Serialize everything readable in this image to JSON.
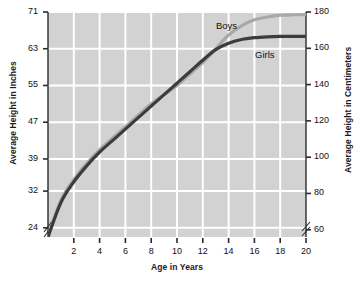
{
  "chart_data": {
    "type": "line",
    "title": "",
    "xlabel": "Age in Years",
    "ylabel": "Average Height in Inches",
    "ylabel_right": "Average Height in Centimeters",
    "xlim": [
      0,
      20
    ],
    "ylim_inches": [
      22,
      71
    ],
    "ylim_cm": [
      56,
      180
    ],
    "grid": true,
    "legend_position": "inline-annotation",
    "x_ticks": [
      2,
      4,
      6,
      8,
      10,
      12,
      14,
      16,
      18,
      20
    ],
    "y_ticks_left": [
      24,
      32,
      39,
      47,
      55,
      63,
      71
    ],
    "y_ticks_right": [
      60,
      80,
      100,
      120,
      140,
      160,
      180
    ],
    "axis_break_left": true,
    "axis_break_right": true,
    "plot_background_color": "#d2d2d2",
    "gridline_color": "#ffffff",
    "x": [
      0,
      1,
      2,
      3,
      4,
      5,
      6,
      7,
      8,
      9,
      10,
      11,
      12,
      13,
      14,
      15,
      16,
      17,
      18,
      19,
      20
    ],
    "series": [
      {
        "name": "Boys",
        "color": "#a8a8a8",
        "values": [
          22.0,
          30.0,
          34.5,
          38.0,
          41.0,
          43.5,
          46.0,
          48.5,
          51.0,
          53.0,
          55.0,
          57.5,
          60.0,
          63.0,
          66.0,
          68.0,
          69.3,
          69.9,
          70.3,
          70.4,
          70.4
        ]
      },
      {
        "name": "Girls",
        "color": "#3c3c3c",
        "values": [
          22.0,
          29.5,
          34.0,
          37.5,
          40.5,
          43.0,
          45.5,
          48.0,
          50.5,
          53.0,
          55.5,
          58.0,
          60.5,
          62.8,
          64.2,
          65.0,
          65.4,
          65.6,
          65.7,
          65.7,
          65.7
        ]
      }
    ],
    "annotations": [
      {
        "text": "Boys",
        "x_px": 216,
        "y_px": 20
      },
      {
        "text": "Girls",
        "x_px": 255,
        "y_px": 49
      }
    ]
  }
}
